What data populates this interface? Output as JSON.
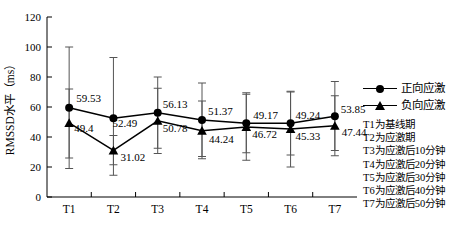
{
  "chart_data": {
    "type": "line",
    "title": "",
    "xlabel": "",
    "ylabel": "RMSSD水平（ms）",
    "categories": [
      "T1",
      "T2",
      "T3",
      "T4",
      "T5",
      "T6",
      "T7"
    ],
    "ylim": [
      0,
      120
    ],
    "yticks": [
      0,
      20,
      40,
      60,
      80,
      100,
      120
    ],
    "grid": false,
    "legend_position": "right-top",
    "series": [
      {
        "name": "正向应激",
        "marker": "circle",
        "values": [
          59.53,
          52.49,
          56.13,
          51.37,
          49.17,
          49.24,
          53.85
        ],
        "labels": [
          "59.53",
          "52.49",
          "56.13",
          "51.37",
          "49.17",
          "49.24",
          "53.85"
        ],
        "err_low": [
          19.0,
          14.5,
          32.5,
          27.0,
          29.5,
          28.0,
          31.0
        ],
        "err_high": [
          100.0,
          93.0,
          80.0,
          76.0,
          69.5,
          70.0,
          77.0
        ]
      },
      {
        "name": "负向应激",
        "marker": "triangle",
        "values": [
          49.4,
          31.02,
          50.78,
          44.24,
          46.72,
          45.33,
          47.44
        ],
        "labels": [
          "49.4",
          "31.02",
          "50.78",
          "44.24",
          "46.72",
          "45.33",
          "47.44"
        ],
        "err_low": [
          26.0,
          21.5,
          29.0,
          25.5,
          24.5,
          20.0,
          27.5
        ],
        "err_high": [
          72.0,
          41.0,
          72.5,
          64.0,
          68.5,
          70.5,
          67.5
        ]
      }
    ],
    "annotations": [
      "T1为基线期",
      "T2为应激期",
      "T3为应激后10分钟",
      "T4为应激后20分钟",
      "T5为应激后30分钟",
      "T6为应激后40分钟",
      "T7为应激后50分钟"
    ]
  },
  "colors": {
    "axis": "#000000",
    "series_positive": "#000000",
    "series_negative": "#000000",
    "errorbar": "#555555",
    "background": "#ffffff"
  }
}
